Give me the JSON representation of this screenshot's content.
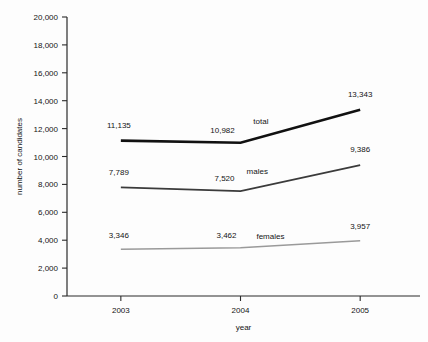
{
  "chart_data": {
    "type": "line",
    "title": "",
    "xlabel": "year",
    "ylabel": "number of candidates",
    "categories": [
      "2003",
      "2004",
      "2005"
    ],
    "x": [
      2003,
      2004,
      2005
    ],
    "xlim": [
      2002.55,
      2005.5
    ],
    "ylim": [
      0,
      20000
    ],
    "ytick_labels": [
      "0",
      "2,000",
      "4,000",
      "6,000",
      "8,000",
      "10,000",
      "12,000",
      "14,000",
      "16,000",
      "18,000",
      "20,000"
    ],
    "ytick_values": [
      0,
      2000,
      4000,
      6000,
      8000,
      10000,
      12000,
      14000,
      16000,
      18000,
      20000
    ],
    "grid": false,
    "legend_position": "inline-series-labels",
    "series": [
      {
        "name": "total",
        "label": "total",
        "color": "#111111",
        "stroke_width": 2.6,
        "values": [
          11135,
          10982,
          13343
        ],
        "data_labels": [
          "11,135",
          "10,982",
          "13,343"
        ]
      },
      {
        "name": "males",
        "label": "males",
        "color": "#3b3b3b",
        "stroke_width": 1.8,
        "values": [
          7789,
          7520,
          9386
        ],
        "data_labels": [
          "7,789",
          "7,520",
          "9,386"
        ]
      },
      {
        "name": "females",
        "label": "females",
        "color": "#9a9a9a",
        "stroke_width": 1.4,
        "values": [
          3346,
          3462,
          3957
        ],
        "data_labels": [
          "3,346",
          "3,462",
          "3,957"
        ]
      }
    ],
    "annotations": [
      {
        "text": "total",
        "x": 2004.17,
        "y": 12350
      },
      {
        "text": "males",
        "x": 2004.14,
        "y": 8750
      },
      {
        "text": "females",
        "x": 2004.25,
        "y": 4100
      }
    ],
    "label_offsets": [
      {
        "series": "total",
        "index": 0,
        "dx": -2,
        "dy": -13,
        "text": "11,135"
      },
      {
        "series": "total",
        "index": 1,
        "dx": -18,
        "dy": -10,
        "text": "10,982"
      },
      {
        "series": "total",
        "index": 2,
        "dx": 0,
        "dy": -13,
        "text": "13,343"
      },
      {
        "series": "males",
        "index": 0,
        "dx": -2,
        "dy": -12,
        "text": "7,789"
      },
      {
        "series": "males",
        "index": 1,
        "dx": -16,
        "dy": -10,
        "text": "7,520"
      },
      {
        "series": "males",
        "index": 2,
        "dx": 0,
        "dy": -13,
        "text": "9,386"
      },
      {
        "series": "females",
        "index": 0,
        "dx": -2,
        "dy": -11,
        "text": "3,346"
      },
      {
        "series": "females",
        "index": 1,
        "dx": -14,
        "dy": -10,
        "text": "3,462"
      },
      {
        "series": "females",
        "index": 2,
        "dx": 0,
        "dy": -12,
        "text": "3,957"
      }
    ]
  }
}
